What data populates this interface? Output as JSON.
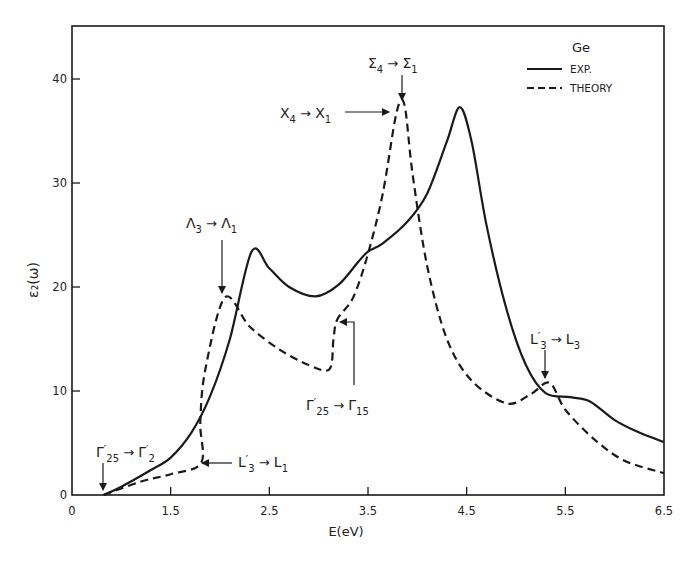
{
  "chart_data": {
    "type": "line",
    "title": "",
    "xlabel": "E(eV)",
    "ylabel": "ε₂(ω)",
    "xlim": [
      0.5,
      6.5
    ],
    "ylim": [
      0,
      45
    ],
    "grid": false,
    "x_ticks": [
      {
        "value": 0.5,
        "label": "0"
      },
      {
        "value": 1.5,
        "label": "1.5"
      },
      {
        "value": 2.5,
        "label": "2.5"
      },
      {
        "value": 3.5,
        "label": "3.5"
      },
      {
        "value": 4.5,
        "label": "4.5"
      },
      {
        "value": 5.5,
        "label": "5.5"
      },
      {
        "value": 6.5,
        "label": "6.5"
      }
    ],
    "y_ticks": [
      {
        "value": 0,
        "label": "0"
      },
      {
        "value": 10,
        "label": "10"
      },
      {
        "value": 20,
        "label": "20"
      },
      {
        "value": 30,
        "label": "30"
      },
      {
        "value": 40,
        "label": "40"
      }
    ],
    "legend": {
      "title": "Ge",
      "position": "upper right",
      "entries": [
        "EXP.",
        "THEORY"
      ]
    },
    "series": [
      {
        "name": "EXP.",
        "style": "solid",
        "x": [
          0.82,
          1.0,
          1.3,
          1.5,
          1.71,
          1.9,
          2.1,
          2.32,
          2.5,
          2.7,
          2.97,
          3.2,
          3.4,
          3.5,
          3.65,
          3.9,
          4.1,
          4.3,
          4.43,
          4.55,
          4.7,
          4.9,
          5.1,
          5.3,
          5.55,
          5.75,
          6.0,
          6.25,
          6.5
        ],
        "values": [
          0,
          0.8,
          2.4,
          3.6,
          6.0,
          9.5,
          15.0,
          23.4,
          21.8,
          20.0,
          19.1,
          20.2,
          22.4,
          23.4,
          24.2,
          26.3,
          29.0,
          34.0,
          37.3,
          34.0,
          26.0,
          18.0,
          12.5,
          9.8,
          9.4,
          9.0,
          7.2,
          6.0,
          5.1
        ]
      },
      {
        "name": "THEORY",
        "style": "dashed",
        "x": [
          0.82,
          1.2,
          1.5,
          1.81,
          1.8,
          1.85,
          2.05,
          2.3,
          2.6,
          2.9,
          3.11,
          3.15,
          3.19,
          3.35,
          3.5,
          3.65,
          3.79,
          3.87,
          3.95,
          4.1,
          4.3,
          4.55,
          4.91,
          5.15,
          5.34,
          5.5,
          5.8,
          6.1,
          6.5
        ],
        "values": [
          0,
          1.3,
          2.0,
          3.1,
          7.0,
          12.0,
          19.0,
          16.2,
          14.0,
          12.5,
          12.1,
          15.0,
          16.9,
          19.0,
          23.2,
          29.0,
          36.8,
          37.5,
          31.0,
          22.0,
          15.0,
          11.0,
          8.8,
          9.7,
          10.8,
          8.2,
          5.3,
          3.3,
          2.1
        ]
      }
    ],
    "annotations": [
      {
        "label_main": "Γ",
        "sub": "25",
        "prime": "′",
        "arrow": "→",
        "label_to": "Γ",
        "sub_to": "2",
        "prime_to": "′",
        "text": "Γ′25 → Γ′2",
        "x": 0.82,
        "y": 0
      },
      {
        "label_main": "L",
        "sub": "3",
        "prime": "′",
        "arrow": "→",
        "label_to": "L",
        "sub_to": "1",
        "prime_to": "",
        "text": "L′3 → L1",
        "x": 1.81,
        "y": 3.1
      },
      {
        "label_main": "Λ",
        "sub": "3",
        "prime": "",
        "arrow": "→",
        "label_to": "Λ",
        "sub_to": "1",
        "prime_to": "",
        "text": "Λ3 → Λ1",
        "x": 2.05,
        "y": 19.0
      },
      {
        "label_main": "Γ",
        "sub": "25",
        "prime": "′",
        "arrow": "→",
        "label_to": "Γ",
        "sub_to": "15",
        "prime_to": "",
        "text": "Γ′25 → Γ15",
        "x": 3.19,
        "y": 16.9
      },
      {
        "label_main": "X",
        "sub": "4",
        "prime": "",
        "arrow": "→",
        "label_to": "X",
        "sub_to": "1",
        "prime_to": "",
        "text": "X4 → X1",
        "x": 3.79,
        "y": 36.8
      },
      {
        "label_main": "Σ",
        "sub": "4",
        "prime": "",
        "arrow": "→",
        "label_to": "Σ",
        "sub_to": "1",
        "prime_to": "",
        "text": "Σ4 → Σ1",
        "x": 3.87,
        "y": 37.5
      },
      {
        "label_main": "L",
        "sub": "3",
        "prime": "′",
        "arrow": "→",
        "label_to": "L",
        "sub_to": "3",
        "prime_to": "",
        "text": "L′3 → L3",
        "x": 5.34,
        "y": 10.8
      }
    ],
    "colors": {
      "line": "#1a1a1a",
      "background": "#ffffff"
    }
  }
}
